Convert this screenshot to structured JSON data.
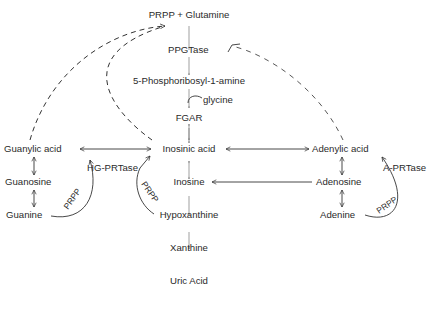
{
  "diagram": {
    "nodes": {
      "prpp_glutamine": "PRPP + Glutamine",
      "ppgtase": "PPGTase",
      "phosphoribosylamine": "5-Phosphoribosyl-1-amine",
      "glycine": "glycine",
      "fgar": "FGAR",
      "guanylic_acid": "Guanylic acid",
      "inosinic_acid": "Inosinic acid",
      "adenylic_acid": "Adenylic acid",
      "guanosine": "Guanosine",
      "hg_prtase": "HG-PRTase",
      "inosine": "Inosine",
      "adenosine": "Adenosine",
      "a_prtase": "A-PRTase",
      "guanine": "Guanine",
      "hypoxanthine": "Hypoxanthine",
      "adenine": "Adenine",
      "xanthine": "Xanthine",
      "uric_acid": "Uric Acid",
      "prpp_left": "PRPP",
      "prpp_mid": "PRPP",
      "prpp_right": "PRPP"
    },
    "edges": [
      {
        "from": "PRPP + Glutamine",
        "to": "5-Phosphoribosyl-1-amine",
        "via": "PPGTase",
        "style": "solid"
      },
      {
        "from": "5-Phosphoribosyl-1-amine",
        "to": "FGAR",
        "cofactor": "glycine",
        "style": "solid"
      },
      {
        "from": "FGAR",
        "to": "Inosinic acid",
        "style": "solid"
      },
      {
        "from": "Inosinic acid",
        "to": "Guanylic acid",
        "style": "bidirectional"
      },
      {
        "from": "Inosinic acid",
        "to": "Adenylic acid",
        "style": "bidirectional"
      },
      {
        "from": "Guanylic acid",
        "to": "Guanosine",
        "style": "bidirectional"
      },
      {
        "from": "Guanosine",
        "to": "Guanine",
        "style": "bidirectional"
      },
      {
        "from": "Inosinic acid",
        "to": "Inosine",
        "style": "bidirectional"
      },
      {
        "from": "Inosine",
        "to": "Hypoxanthine",
        "style": "bidirectional"
      },
      {
        "from": "Adenylic acid",
        "to": "Adenosine",
        "style": "bidirectional"
      },
      {
        "from": "Adenosine",
        "to": "Adenine",
        "style": "bidirectional"
      },
      {
        "from": "Adenosine",
        "to": "Inosine",
        "style": "solid"
      },
      {
        "from": "Hypoxanthine",
        "to": "Xanthine",
        "style": "solid"
      },
      {
        "from": "Xanthine",
        "to": "Uric Acid",
        "style": "solid"
      },
      {
        "from": "Guanine",
        "to": "Guanylic acid",
        "via": "HG-PRTase",
        "cofactor": "PRPP",
        "style": "solid"
      },
      {
        "from": "Hypoxanthine",
        "to": "Inosinic acid",
        "via": "HG-PRTase",
        "cofactor": "PRPP",
        "style": "solid"
      },
      {
        "from": "Adenine",
        "to": "Adenylic acid",
        "via": "A-PRTase",
        "cofactor": "PRPP",
        "style": "solid"
      },
      {
        "from": "Guanylic acid",
        "to": "PPGTase",
        "style": "dashed",
        "meaning": "feedback"
      },
      {
        "from": "Inosinic acid",
        "to": "PPGTase",
        "style": "dashed",
        "meaning": "feedback"
      },
      {
        "from": "Adenylic acid",
        "to": "PPGTase",
        "style": "dashed",
        "meaning": "feedback inhibition"
      }
    ]
  }
}
